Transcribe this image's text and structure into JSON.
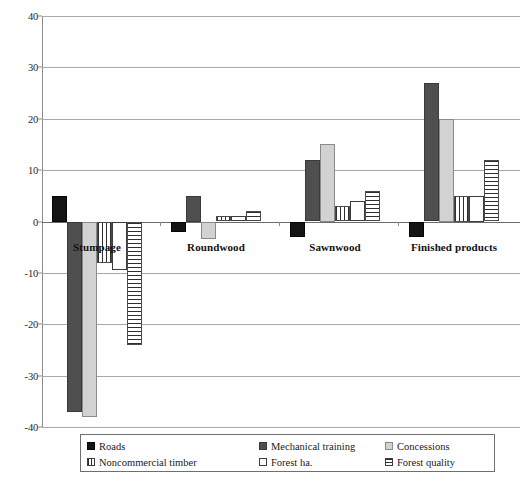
{
  "chart_data": {
    "type": "bar",
    "title": "",
    "subtitle": "",
    "xlabel": "",
    "ylabel": "",
    "ylim": [
      -40,
      40
    ],
    "ytick_labels": [
      "40",
      "30",
      "20",
      "10",
      "0",
      "-10",
      "-20",
      "-30",
      "-40"
    ],
    "ytick_values": [
      40,
      30,
      20,
      10,
      0,
      -10,
      -20,
      -30,
      -40
    ],
    "grid": true,
    "orientation": "vertical",
    "grouped": true,
    "legend_position": "bottom",
    "categories": [
      "Stumpage",
      "Roundwood",
      "Sawnwood",
      "Finished products"
    ],
    "series": [
      {
        "name": "Roads",
        "key": "roads",
        "color": "#141414",
        "pattern": "solid-black",
        "values": [
          5,
          -2,
          -3,
          -3
        ]
      },
      {
        "name": "Mechanical training",
        "key": "mech",
        "color": "#4f4f4f",
        "pattern": "solid-dark-gray",
        "values": [
          -37,
          5,
          12,
          27
        ]
      },
      {
        "name": "Concessions",
        "key": "conc",
        "color": "#d2d2d2",
        "pattern": "solid-light-gray",
        "values": [
          -38,
          -3.5,
          15,
          20
        ]
      },
      {
        "name": "Noncommercial timber",
        "key": "noncom",
        "color": "#ffffff",
        "pattern": "vertical-stripes",
        "values": [
          -8,
          1,
          3,
          5
        ]
      },
      {
        "name": "Forest ha.",
        "key": "foresth",
        "color": "#ffffff",
        "pattern": "empty",
        "values": [
          -9.5,
          1,
          4,
          5
        ]
      },
      {
        "name": "Forest quality",
        "key": "quality",
        "color": "#ffffff",
        "pattern": "horizontal-stripes",
        "values": [
          -24,
          2,
          6,
          12
        ]
      }
    ]
  },
  "legend": {
    "entries": [
      {
        "label": "Roads",
        "swatch": "roads-swatch"
      },
      {
        "label": "Mechanical training",
        "swatch": "mechanical-training-swatch"
      },
      {
        "label": "Concessions",
        "swatch": "concessions-swatch"
      },
      {
        "label": "Noncommercial timber",
        "swatch": "noncommercial-timber-swatch"
      },
      {
        "label": "Forest ha.",
        "swatch": "forest-ha-swatch"
      },
      {
        "label": "Forest quality",
        "swatch": "forest-quality-swatch"
      }
    ]
  },
  "colors": {
    "roads": "#141414",
    "mechanical_training": "#4f4f4f",
    "concessions": "#d2d2d2",
    "stripe": "#2f2f2f",
    "gridline": "#a9a9a9",
    "axis": "#8d8d8d",
    "background": "#ffffff"
  }
}
